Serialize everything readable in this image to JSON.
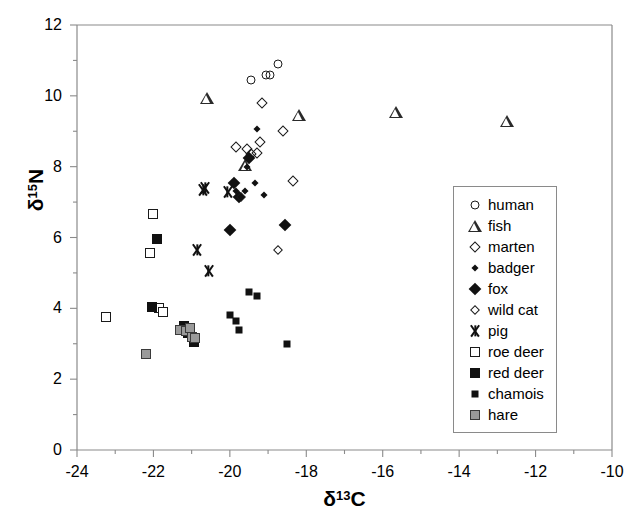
{
  "chart_data": {
    "type": "scatter",
    "title": "",
    "xlabel": "δ13C",
    "ylabel": "δ15N",
    "xlabel_base": "δ",
    "xlabel_sup": "13",
    "xlabel_tail": "C",
    "ylabel_base": "δ",
    "ylabel_sup": "15",
    "ylabel_tail": "N",
    "xlim": [
      -24,
      -10
    ],
    "ylim": [
      0,
      12
    ],
    "xticks": [
      -24,
      -22,
      -20,
      -18,
      -16,
      -14,
      -12,
      -10
    ],
    "yticks": [
      0,
      2,
      4,
      6,
      8,
      10,
      12
    ],
    "xminor_step": 1,
    "yminor_step": 1,
    "grid": false,
    "legend_position": "right-lower",
    "frame": true,
    "series": [
      {
        "name": "human",
        "marker": "open-circle",
        "color": "#1a1a1a",
        "points": [
          [
            -19.45,
            10.45
          ],
          [
            -19.05,
            10.6
          ],
          [
            -18.95,
            10.6
          ],
          [
            -18.75,
            10.9
          ]
        ]
      },
      {
        "name": "fish",
        "marker": "open-triangle",
        "color": "#2a2a2a",
        "points": [
          [
            -20.6,
            9.95
          ],
          [
            -19.6,
            8.05
          ],
          [
            -18.2,
            9.45
          ],
          [
            -15.65,
            9.55
          ],
          [
            -12.75,
            9.3
          ]
        ]
      },
      {
        "name": "marten",
        "marker": "open-diamond-large",
        "color": "#1a1a1a",
        "points": [
          [
            -19.85,
            8.55
          ],
          [
            -19.55,
            8.5
          ],
          [
            -19.45,
            8.35
          ],
          [
            -19.2,
            8.7
          ],
          [
            -19.3,
            8.4
          ],
          [
            -19.15,
            9.8
          ],
          [
            -18.6,
            9.0
          ],
          [
            -18.35,
            7.6
          ]
        ]
      },
      {
        "name": "badger",
        "marker": "small-filled-diamond",
        "color": "#111111",
        "points": [
          [
            -19.3,
            9.05
          ],
          [
            -19.55,
            8.0
          ],
          [
            -19.35,
            7.55
          ],
          [
            -19.6,
            7.3
          ],
          [
            -19.1,
            7.2
          ],
          [
            -19.85,
            7.3
          ]
        ]
      },
      {
        "name": "fox",
        "marker": "large-filled-diamond",
        "color": "#111111",
        "points": [
          [
            -19.5,
            8.25
          ],
          [
            -19.9,
            7.55
          ],
          [
            -19.75,
            7.15
          ],
          [
            -20.0,
            6.2
          ],
          [
            -18.55,
            6.35
          ]
        ]
      },
      {
        "name": "wild cat",
        "marker": "open-diamond-small",
        "color": "#1a1a1a",
        "points": [
          [
            -19.7,
            7.15
          ],
          [
            -18.75,
            5.65
          ]
        ]
      },
      {
        "name": "pig",
        "marker": "asterisk",
        "color": "#111111",
        "points": [
          [
            -20.65,
            7.4
          ],
          [
            -20.7,
            7.35
          ],
          [
            -20.05,
            7.3
          ],
          [
            -20.85,
            5.65
          ],
          [
            -20.55,
            5.05
          ]
        ]
      },
      {
        "name": "roe deer",
        "marker": "open-square",
        "color": "#1a1a1a",
        "points": [
          [
            -23.25,
            3.75
          ],
          [
            -22.0,
            6.65
          ],
          [
            -22.1,
            5.55
          ],
          [
            -21.85,
            4.0
          ],
          [
            -21.75,
            3.9
          ]
        ]
      },
      {
        "name": "red deer",
        "marker": "filled-square-large",
        "color": "#111111",
        "points": [
          [
            -21.9,
            5.95
          ],
          [
            -22.05,
            4.05
          ],
          [
            -21.2,
            3.5
          ],
          [
            -21.1,
            3.3
          ],
          [
            -21.0,
            3.2
          ],
          [
            -20.95,
            3.05
          ]
        ]
      },
      {
        "name": "chamois",
        "marker": "filled-square-small",
        "color": "#111111",
        "points": [
          [
            -19.5,
            4.45
          ],
          [
            -19.3,
            4.35
          ],
          [
            -20.0,
            3.8
          ],
          [
            -19.85,
            3.65
          ],
          [
            -19.75,
            3.4
          ],
          [
            -18.5,
            3.0
          ]
        ]
      },
      {
        "name": "hare",
        "marker": "gray-square",
        "color": "#9a9a9a",
        "points": [
          [
            -22.2,
            2.7
          ],
          [
            -21.3,
            3.4
          ],
          [
            -21.15,
            3.35
          ],
          [
            -21.0,
            3.2
          ],
          [
            -20.9,
            3.15
          ],
          [
            -21.05,
            3.45
          ]
        ]
      }
    ]
  },
  "legend": {
    "entries": [
      {
        "label": "human",
        "marker": "open-circle"
      },
      {
        "label": "fish",
        "marker": "open-triangle"
      },
      {
        "label": "marten",
        "marker": "open-diamond-large"
      },
      {
        "label": "badger",
        "marker": "small-filled-diamond"
      },
      {
        "label": "fox",
        "marker": "large-filled-diamond"
      },
      {
        "label": "wild cat",
        "marker": "open-diamond-small"
      },
      {
        "label": "pig",
        "marker": "asterisk"
      },
      {
        "label": "roe deer",
        "marker": "open-square"
      },
      {
        "label": "red deer",
        "marker": "filled-square-large"
      },
      {
        "label": "chamois",
        "marker": "filled-square-small"
      },
      {
        "label": "hare",
        "marker": "gray-square"
      }
    ]
  }
}
